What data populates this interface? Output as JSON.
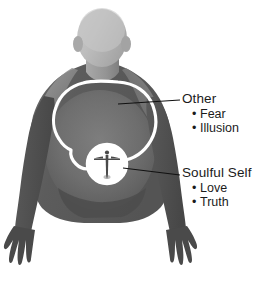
{
  "figure": {
    "body_color": "#5e5e5e",
    "torso_highlight_color": "#7a7a7a",
    "head_color": "#b5b5b5",
    "shoulder_color": "#9a9a9a",
    "background_color": "#ffffff",
    "outline_color": "#ffffff",
    "inner_circle_fill": "#ffffff",
    "inner_figure_color": "#4a4a4a",
    "leader_line_color": "#111111"
  },
  "callouts": [
    {
      "id": "other",
      "title": "Other",
      "items": [
        "Fear",
        "Illusion"
      ],
      "bullet": "•"
    },
    {
      "id": "soulful",
      "title": "Soulful Self",
      "items": [
        "Love",
        "Truth"
      ],
      "bullet": "•"
    }
  ]
}
